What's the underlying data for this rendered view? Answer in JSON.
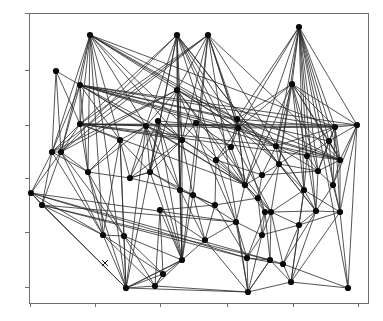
{
  "figure": {
    "background_color": "#ffffff",
    "axis_color": "#6e6e6e",
    "edge_color": "#2b2b2b",
    "node_color": "#0a0a0a",
    "title": "",
    "xlabel": "",
    "ylabel": ""
  },
  "chart_data": {
    "type": "scatter",
    "title": "",
    "xlabel": "",
    "ylabel": "",
    "subtitle": "",
    "legend": [],
    "grid": false,
    "annotations": [
      {
        "name": "x-marker",
        "x": 105,
        "y": 263,
        "symbol": "x"
      }
    ],
    "plot_area": {
      "left": 29,
      "top": 13,
      "right": 368,
      "bottom": 303
    },
    "xlim": [
      0,
      1
    ],
    "ylim": [
      0,
      1
    ],
    "x_ticks": [
      30,
      95,
      160,
      227,
      293,
      358
    ],
    "y_ticks": [
      13,
      70,
      125,
      178,
      232,
      287
    ],
    "x_tick_labels": [
      "",
      "",
      "",
      "",
      "",
      ""
    ],
    "y_tick_labels": [
      "",
      "",
      "",
      "",
      "",
      ""
    ],
    "node_count": 62,
    "edge_count": 188,
    "nodes": [
      {
        "id": 0,
        "x": 90,
        "y": 35
      },
      {
        "id": 1,
        "x": 177,
        "y": 35
      },
      {
        "id": 2,
        "x": 208,
        "y": 35
      },
      {
        "id": 3,
        "x": 299,
        "y": 27
      },
      {
        "id": 4,
        "x": 56,
        "y": 71
      },
      {
        "id": 5,
        "x": 80,
        "y": 85
      },
      {
        "id": 6,
        "x": 177,
        "y": 90
      },
      {
        "id": 7,
        "x": 292,
        "y": 84
      },
      {
        "id": 8,
        "x": 80,
        "y": 124
      },
      {
        "id": 9,
        "x": 146,
        "y": 126
      },
      {
        "id": 10,
        "x": 158,
        "y": 121
      },
      {
        "id": 11,
        "x": 237,
        "y": 119
      },
      {
        "id": 12,
        "x": 238,
        "y": 128
      },
      {
        "id": 13,
        "x": 335,
        "y": 127
      },
      {
        "id": 14,
        "x": 357,
        "y": 125
      },
      {
        "id": 15,
        "x": 120,
        "y": 140
      },
      {
        "id": 16,
        "x": 182,
        "y": 140
      },
      {
        "id": 17,
        "x": 276,
        "y": 146
      },
      {
        "id": 18,
        "x": 52,
        "y": 152
      },
      {
        "id": 19,
        "x": 61,
        "y": 152
      },
      {
        "id": 20,
        "x": 279,
        "y": 164
      },
      {
        "id": 21,
        "x": 340,
        "y": 160
      },
      {
        "id": 22,
        "x": 307,
        "y": 156
      },
      {
        "id": 23,
        "x": 88,
        "y": 172
      },
      {
        "id": 24,
        "x": 150,
        "y": 172
      },
      {
        "id": 25,
        "x": 31,
        "y": 193
      },
      {
        "id": 26,
        "x": 42,
        "y": 205
      },
      {
        "id": 27,
        "x": 180,
        "y": 190
      },
      {
        "id": 28,
        "x": 193,
        "y": 195
      },
      {
        "id": 29,
        "x": 245,
        "y": 185
      },
      {
        "id": 30,
        "x": 304,
        "y": 190
      },
      {
        "id": 31,
        "x": 333,
        "y": 185
      },
      {
        "id": 32,
        "x": 271,
        "y": 212
      },
      {
        "id": 33,
        "x": 316,
        "y": 211
      },
      {
        "id": 34,
        "x": 160,
        "y": 210
      },
      {
        "id": 35,
        "x": 236,
        "y": 222
      },
      {
        "id": 36,
        "x": 265,
        "y": 212
      },
      {
        "id": 37,
        "x": 340,
        "y": 212
      },
      {
        "id": 38,
        "x": 103,
        "y": 235
      },
      {
        "id": 39,
        "x": 124,
        "y": 236
      },
      {
        "id": 40,
        "x": 182,
        "y": 260
      },
      {
        "id": 41,
        "x": 247,
        "y": 258
      },
      {
        "id": 42,
        "x": 270,
        "y": 260
      },
      {
        "id": 43,
        "x": 283,
        "y": 264
      },
      {
        "id": 44,
        "x": 163,
        "y": 274
      },
      {
        "id": 45,
        "x": 126,
        "y": 288
      },
      {
        "id": 46,
        "x": 155,
        "y": 286
      },
      {
        "id": 47,
        "x": 248,
        "y": 292
      },
      {
        "id": 48,
        "x": 291,
        "y": 282
      },
      {
        "id": 49,
        "x": 348,
        "y": 288
      },
      {
        "id": 50,
        "x": 329,
        "y": 141
      },
      {
        "id": 51,
        "x": 216,
        "y": 160
      },
      {
        "id": 52,
        "x": 196,
        "y": 123
      },
      {
        "id": 53,
        "x": 262,
        "y": 175
      },
      {
        "id": 54,
        "x": 258,
        "y": 198
      },
      {
        "id": 55,
        "x": 130,
        "y": 178
      },
      {
        "id": 56,
        "x": 215,
        "y": 205
      },
      {
        "id": 57,
        "x": 299,
        "y": 225
      },
      {
        "id": 58,
        "x": 262,
        "y": 235
      },
      {
        "id": 59,
        "x": 205,
        "y": 240
      },
      {
        "id": 60,
        "x": 318,
        "y": 171
      },
      {
        "id": 61,
        "x": 231,
        "y": 147
      }
    ],
    "edges": [
      [
        0,
        5
      ],
      [
        0,
        8
      ],
      [
        0,
        18
      ],
      [
        0,
        19
      ],
      [
        0,
        23
      ],
      [
        0,
        15
      ],
      [
        0,
        38
      ],
      [
        0,
        45
      ],
      [
        0,
        16
      ],
      [
        0,
        9
      ],
      [
        0,
        29
      ],
      [
        0,
        12
      ],
      [
        0,
        11
      ],
      [
        0,
        21
      ],
      [
        0,
        13
      ],
      [
        0,
        17
      ],
      [
        1,
        6
      ],
      [
        1,
        9
      ],
      [
        1,
        16
      ],
      [
        1,
        24
      ],
      [
        1,
        27
      ],
      [
        1,
        40
      ],
      [
        1,
        45
      ],
      [
        1,
        19
      ],
      [
        1,
        8
      ],
      [
        1,
        12
      ],
      [
        1,
        29
      ],
      [
        1,
        35
      ],
      [
        1,
        32
      ],
      [
        1,
        33
      ],
      [
        1,
        20
      ],
      [
        2,
        6
      ],
      [
        2,
        16
      ],
      [
        2,
        28
      ],
      [
        2,
        40
      ],
      [
        2,
        47
      ],
      [
        2,
        18
      ],
      [
        2,
        19
      ],
      [
        2,
        8
      ],
      [
        2,
        12
      ],
      [
        2,
        11
      ],
      [
        2,
        21
      ],
      [
        2,
        30
      ],
      [
        2,
        36
      ],
      [
        3,
        7
      ],
      [
        3,
        13
      ],
      [
        3,
        14
      ],
      [
        3,
        21
      ],
      [
        3,
        17
      ],
      [
        3,
        20
      ],
      [
        3,
        30
      ],
      [
        3,
        33
      ],
      [
        3,
        37
      ],
      [
        3,
        49
      ],
      [
        3,
        12
      ],
      [
        3,
        11
      ],
      [
        3,
        29
      ],
      [
        3,
        22
      ],
      [
        3,
        50
      ],
      [
        3,
        60
      ],
      [
        4,
        5
      ],
      [
        4,
        18
      ],
      [
        4,
        19
      ],
      [
        4,
        8
      ],
      [
        5,
        8
      ],
      [
        5,
        18
      ],
      [
        5,
        19
      ],
      [
        5,
        23
      ],
      [
        5,
        15
      ],
      [
        5,
        9
      ],
      [
        5,
        16
      ],
      [
        5,
        12
      ],
      [
        5,
        11
      ],
      [
        5,
        29
      ],
      [
        5,
        17
      ],
      [
        5,
        21
      ],
      [
        5,
        13
      ],
      [
        5,
        14
      ],
      [
        5,
        50
      ],
      [
        6,
        9
      ],
      [
        6,
        16
      ],
      [
        6,
        24
      ],
      [
        6,
        27
      ],
      [
        6,
        40
      ],
      [
        6,
        19
      ],
      [
        6,
        18
      ],
      [
        6,
        11
      ],
      [
        6,
        12
      ],
      [
        6,
        29
      ],
      [
        6,
        35
      ],
      [
        6,
        32
      ],
      [
        7,
        13
      ],
      [
        7,
        14
      ],
      [
        7,
        17
      ],
      [
        7,
        20
      ],
      [
        7,
        21
      ],
      [
        7,
        30
      ],
      [
        7,
        12
      ],
      [
        7,
        11
      ],
      [
        7,
        29
      ],
      [
        7,
        50
      ],
      [
        7,
        60
      ],
      [
        7,
        22
      ],
      [
        8,
        18
      ],
      [
        8,
        19
      ],
      [
        8,
        23
      ],
      [
        8,
        15
      ],
      [
        8,
        9
      ],
      [
        8,
        16
      ],
      [
        8,
        29
      ],
      [
        8,
        12
      ],
      [
        8,
        21
      ],
      [
        8,
        13
      ],
      [
        8,
        14
      ],
      [
        8,
        17
      ],
      [
        9,
        16
      ],
      [
        9,
        24
      ],
      [
        9,
        15
      ],
      [
        9,
        27
      ],
      [
        9,
        23
      ],
      [
        9,
        55
      ],
      [
        9,
        40
      ],
      [
        9,
        45
      ],
      [
        9,
        29
      ],
      [
        10,
        16
      ],
      [
        10,
        24
      ],
      [
        10,
        27
      ],
      [
        10,
        55
      ],
      [
        10,
        40
      ],
      [
        10,
        29
      ],
      [
        10,
        12
      ],
      [
        11,
        12
      ],
      [
        11,
        29
      ],
      [
        11,
        17
      ],
      [
        11,
        21
      ],
      [
        11,
        13
      ],
      [
        11,
        20
      ],
      [
        11,
        61
      ],
      [
        11,
        53
      ],
      [
        12,
        29
      ],
      [
        12,
        17
      ],
      [
        12,
        21
      ],
      [
        12,
        13
      ],
      [
        12,
        20
      ],
      [
        12,
        61
      ],
      [
        12,
        51
      ],
      [
        13,
        14
      ],
      [
        13,
        21
      ],
      [
        13,
        50
      ],
      [
        13,
        17
      ],
      [
        13,
        20
      ],
      [
        13,
        37
      ],
      [
        13,
        60
      ],
      [
        13,
        31
      ],
      [
        14,
        21
      ],
      [
        14,
        50
      ],
      [
        14,
        31
      ],
      [
        14,
        37
      ],
      [
        14,
        49
      ],
      [
        15,
        23
      ],
      [
        15,
        24
      ],
      [
        15,
        38
      ],
      [
        15,
        39
      ],
      [
        15,
        45
      ],
      [
        15,
        55
      ],
      [
        16,
        24
      ],
      [
        16,
        27
      ],
      [
        16,
        28
      ],
      [
        16,
        40
      ],
      [
        16,
        55
      ],
      [
        16,
        51
      ],
      [
        17,
        20
      ],
      [
        17,
        21
      ],
      [
        17,
        22
      ],
      [
        17,
        30
      ],
      [
        17,
        53
      ],
      [
        17,
        60
      ],
      [
        18,
        19
      ],
      [
        18,
        23
      ],
      [
        18,
        25
      ],
      [
        18,
        26
      ],
      [
        18,
        38
      ],
      [
        19,
        23
      ],
      [
        19,
        25
      ],
      [
        19,
        26
      ],
      [
        19,
        38
      ],
      [
        19,
        39
      ],
      [
        20,
        30
      ],
      [
        20,
        32
      ],
      [
        20,
        33
      ],
      [
        20,
        53
      ],
      [
        20,
        60
      ],
      [
        20,
        54
      ],
      [
        21,
        31
      ],
      [
        21,
        37
      ],
      [
        21,
        50
      ],
      [
        21,
        60
      ],
      [
        22,
        30
      ],
      [
        22,
        33
      ],
      [
        22,
        50
      ],
      [
        22,
        60
      ],
      [
        23,
        38
      ],
      [
        23,
        39
      ],
      [
        23,
        45
      ],
      [
        23,
        55
      ],
      [
        24,
        27
      ],
      [
        24,
        28
      ],
      [
        24,
        40
      ],
      [
        24,
        55
      ],
      [
        25,
        26
      ],
      [
        25,
        38
      ],
      [
        25,
        45
      ],
      [
        25,
        35
      ],
      [
        25,
        41
      ],
      [
        25,
        42
      ],
      [
        26,
        38
      ],
      [
        26,
        45
      ],
      [
        26,
        41
      ],
      [
        26,
        42
      ],
      [
        26,
        35
      ],
      [
        27,
        28
      ],
      [
        27,
        40
      ],
      [
        27,
        56
      ],
      [
        27,
        59
      ],
      [
        28,
        40
      ],
      [
        28,
        56
      ],
      [
        28,
        59
      ],
      [
        28,
        35
      ],
      [
        29,
        35
      ],
      [
        29,
        36
      ],
      [
        29,
        32
      ],
      [
        29,
        53
      ],
      [
        29,
        54
      ],
      [
        29,
        51
      ],
      [
        30,
        33
      ],
      [
        30,
        32
      ],
      [
        30,
        37
      ],
      [
        30,
        57
      ],
      [
        30,
        48
      ],
      [
        31,
        37
      ],
      [
        31,
        50
      ],
      [
        31,
        60
      ],
      [
        31,
        33
      ],
      [
        32,
        33
      ],
      [
        32,
        36
      ],
      [
        32,
        42
      ],
      [
        32,
        43
      ],
      [
        32,
        57
      ],
      [
        32,
        58
      ],
      [
        33,
        37
      ],
      [
        33,
        48
      ],
      [
        33,
        57
      ],
      [
        33,
        43
      ],
      [
        34,
        40
      ],
      [
        34,
        44
      ],
      [
        34,
        46
      ],
      [
        34,
        59
      ],
      [
        34,
        56
      ],
      [
        35,
        41
      ],
      [
        35,
        47
      ],
      [
        35,
        58
      ],
      [
        35,
        59
      ],
      [
        36,
        42
      ],
      [
        36,
        41
      ],
      [
        36,
        58
      ],
      [
        36,
        54
      ],
      [
        37,
        48
      ],
      [
        37,
        49
      ],
      [
        37,
        57
      ],
      [
        38,
        39
      ],
      [
        38,
        45
      ],
      [
        38,
        46
      ],
      [
        38,
        44
      ],
      [
        39,
        45
      ],
      [
        39,
        46
      ],
      [
        39,
        44
      ],
      [
        39,
        40
      ],
      [
        40,
        44
      ],
      [
        40,
        46
      ],
      [
        40,
        45
      ],
      [
        40,
        59
      ],
      [
        41,
        42
      ],
      [
        41,
        43
      ],
      [
        41,
        47
      ],
      [
        41,
        58
      ],
      [
        42,
        43
      ],
      [
        42,
        47
      ],
      [
        42,
        48
      ],
      [
        43,
        48
      ],
      [
        43,
        49
      ],
      [
        43,
        57
      ],
      [
        44,
        45
      ],
      [
        44,
        46
      ],
      [
        45,
        46
      ],
      [
        45,
        47
      ],
      [
        45,
        40
      ],
      [
        46,
        47
      ],
      [
        46,
        44
      ],
      [
        47,
        48
      ],
      [
        47,
        42
      ],
      [
        48,
        49
      ],
      [
        50,
        60
      ],
      [
        50,
        21
      ],
      [
        51,
        53
      ],
      [
        51,
        56
      ],
      [
        52,
        61
      ],
      [
        52,
        16
      ],
      [
        53,
        54
      ],
      [
        53,
        60
      ],
      [
        54,
        58
      ],
      [
        54,
        56
      ],
      [
        55,
        24
      ],
      [
        55,
        27
      ],
      [
        56,
        59
      ],
      [
        56,
        41
      ],
      [
        57,
        58
      ],
      [
        57,
        48
      ],
      [
        58,
        47
      ],
      [
        59,
        47
      ],
      [
        60,
        33
      ],
      [
        61,
        51
      ],
      [
        61,
        29
      ]
    ]
  }
}
